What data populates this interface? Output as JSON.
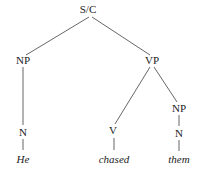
{
  "diagram": {
    "type": "syntax-tree",
    "nodes": {
      "root": {
        "label": "S/C",
        "x": 88,
        "y": 13
      },
      "np_subj": {
        "label": "NP",
        "x": 23,
        "y": 64
      },
      "vp": {
        "label": "VP",
        "x": 152,
        "y": 64
      },
      "n_subj": {
        "label": "N",
        "x": 23,
        "y": 136
      },
      "v": {
        "label": "V",
        "x": 113,
        "y": 134
      },
      "np_obj": {
        "label": "NP",
        "x": 179,
        "y": 112
      },
      "n_obj": {
        "label": "N",
        "x": 179,
        "y": 137
      }
    },
    "words": {
      "he": {
        "label": "He",
        "x": 23,
        "y": 163
      },
      "chased": {
        "label": "chased",
        "x": 114,
        "y": 163
      },
      "them": {
        "label": "them",
        "x": 179,
        "y": 163
      }
    },
    "edges": [
      [
        "root",
        "np_subj"
      ],
      [
        "root",
        "vp"
      ],
      [
        "np_subj",
        "n_subj"
      ],
      [
        "vp",
        "v"
      ],
      [
        "vp",
        "np_obj"
      ],
      [
        "np_obj",
        "n_obj"
      ],
      [
        "n_subj",
        "he"
      ],
      [
        "v",
        "chased"
      ],
      [
        "n_obj",
        "them"
      ]
    ]
  }
}
